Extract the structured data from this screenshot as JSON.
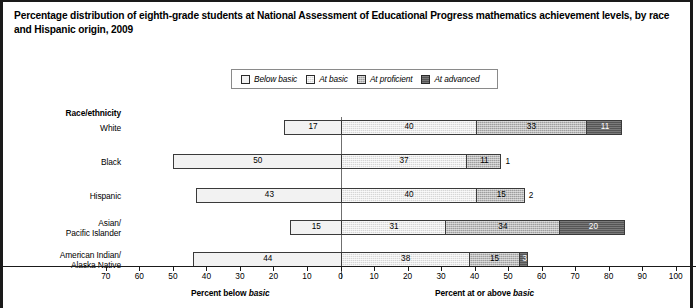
{
  "title": "Percentage distribution of eighth-grade students at National Assessment of Educational Progress mathematics achievement levels, by race and Hispanic origin, 2009",
  "legend": {
    "items": [
      {
        "label": "Below basic",
        "swatch": "very-light-gray"
      },
      {
        "label": "At basic",
        "swatch": "light-gray"
      },
      {
        "label": "At proficient",
        "swatch": "medium-gray"
      },
      {
        "label": "At advanced",
        "swatch": "dark-gray"
      }
    ]
  },
  "row_header": "Race/ethnicity",
  "axis": {
    "left_caption_prefix": "Percent below ",
    "left_caption_italic": "basic",
    "right_caption_prefix": "Percent at or above ",
    "right_caption_italic": "basic",
    "ticks": [
      "70",
      "60",
      "50",
      "40",
      "30",
      "20",
      "10",
      "0",
      "10",
      "20",
      "30",
      "40",
      "50",
      "60",
      "70",
      "80",
      "90",
      "100"
    ]
  },
  "footnote": "",
  "chart_data": {
    "type": "bar",
    "title": "Percentage distribution of eighth-grade students at National Assessment of Educational Progress mathematics achievement levels, by race and Hispanic origin, 2009",
    "orientation": "horizontal",
    "stacked": true,
    "diverging_at": 0,
    "xlabel": "Percent",
    "ylabel": "Race/ethnicity",
    "xlim": [
      -70,
      100
    ],
    "grid": false,
    "legend_position": "top-center",
    "categories": [
      "White",
      "Black",
      "Hispanic",
      "Asian/\nPacific Islander",
      "American Indian/\nAlaska Native"
    ],
    "series": [
      {
        "name": "Below basic",
        "values": [
          17,
          50,
          43,
          15,
          44
        ]
      },
      {
        "name": "At basic",
        "values": [
          40,
          37,
          40,
          31,
          38
        ]
      },
      {
        "name": "At proficient",
        "values": [
          33,
          11,
          15,
          34,
          15
        ]
      },
      {
        "name": "At advanced",
        "values": [
          11,
          1,
          2,
          20,
          3
        ]
      }
    ],
    "rows": [
      {
        "label": "White",
        "label_lines": [
          "White"
        ],
        "below_basic": 17,
        "at_basic": 40,
        "at_proficient": 33,
        "at_advanced": 11,
        "advanced_outside": false
      },
      {
        "label": "Black",
        "label_lines": [
          "Black"
        ],
        "below_basic": 50,
        "at_basic": 37,
        "at_proficient": 11,
        "at_advanced": 1,
        "advanced_outside": true
      },
      {
        "label": "Hispanic",
        "label_lines": [
          "Hispanic"
        ],
        "below_basic": 43,
        "at_basic": 40,
        "at_proficient": 15,
        "at_advanced": 2,
        "advanced_outside": true
      },
      {
        "label": "Asian/Pacific Islander",
        "label_lines": [
          "Asian/",
          "Pacific Islander"
        ],
        "below_basic": 15,
        "at_basic": 31,
        "at_proficient": 34,
        "at_advanced": 20,
        "advanced_outside": false
      },
      {
        "label": "American Indian/Alaska Native",
        "label_lines": [
          "American Indian/",
          "Alaska Native"
        ],
        "below_basic": 44,
        "at_basic": 38,
        "at_proficient": 15,
        "at_advanced": 3,
        "advanced_outside": false
      }
    ]
  }
}
